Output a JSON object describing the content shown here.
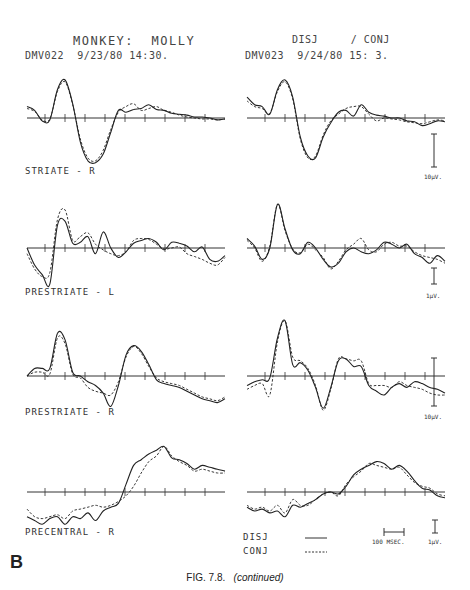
{
  "header": {
    "left_title": "MONKEY:  MOLLY",
    "left_run": "DMV022  9/23/80 14:30.",
    "right_title": "DISJ     / CONJ",
    "right_run": "DMV023  9/24/80 15: 3."
  },
  "panels": {
    "labels": [
      "STRIATE - R",
      "PRESTRIATE - L",
      "PRESTRIATE - R",
      "PRECENTRAL - R"
    ],
    "scale_bars": [
      "10µV.",
      "1µV.",
      "10µV.",
      "1µV."
    ]
  },
  "legend": {
    "disj": "DISJ",
    "conj": "CONJ",
    "time_bar": "100 MSEC.",
    "volt_bar": "1µV."
  },
  "figure": {
    "panel_letter": "B",
    "caption_prefix": "FIG. 7.8.",
    "caption_suffix": "(continued)"
  },
  "chart_data": {
    "type": "line",
    "xlabel": "time (ticks = 100 msec)",
    "ylabel": "amplitude",
    "grid": false,
    "legend_position": "bottom-right",
    "series_names": [
      "DISJ (solid)",
      "CONJ (dashed)"
    ],
    "panels": [
      {
        "row": 0,
        "col": 0,
        "region": "STRIATE - R",
        "session": "DMV022",
        "disj": [
          12,
          8,
          -3,
          -2,
          30,
          40,
          15,
          -25,
          -45,
          -47,
          -38,
          -15,
          8,
          6,
          9,
          10,
          14,
          9,
          8,
          5,
          4,
          3,
          1,
          1,
          0,
          -2,
          -1
        ],
        "conj": [
          10,
          7,
          -2,
          -1,
          28,
          38,
          14,
          -22,
          -42,
          -45,
          -34,
          -12,
          6,
          12,
          15,
          8,
          10,
          12,
          8,
          6,
          3,
          1,
          0,
          -1,
          -1,
          -2,
          -1
        ]
      },
      {
        "row": 0,
        "col": 1,
        "region": "STRIATE - R",
        "session": "DMV023",
        "disj": [
          22,
          14,
          12,
          4,
          30,
          40,
          22,
          -20,
          -40,
          -42,
          -20,
          -5,
          6,
          8,
          2,
          14,
          6,
          3,
          2,
          0,
          0,
          -3,
          -4,
          -8,
          -6,
          -3,
          -4
        ],
        "conj": [
          18,
          12,
          10,
          5,
          28,
          38,
          20,
          -22,
          -42,
          -40,
          -18,
          -3,
          4,
          10,
          12,
          12,
          4,
          -3,
          0,
          -1,
          -2,
          -4,
          -5,
          -6,
          -4,
          -2,
          -3
        ]
      },
      {
        "row": 1,
        "col": 0,
        "region": "PRESTRIATE - L",
        "session": "DMV022",
        "disj": [
          0,
          -18,
          -28,
          -38,
          24,
          28,
          5,
          6,
          12,
          -6,
          17,
          0,
          -10,
          -4,
          5,
          8,
          10,
          6,
          -2,
          6,
          5,
          2,
          -4,
          1,
          -12,
          -14,
          -8
        ],
        "conj": [
          -6,
          -22,
          -30,
          -26,
          30,
          40,
          8,
          12,
          16,
          4,
          -2,
          -6,
          -8,
          -4,
          8,
          10,
          9,
          4,
          -1,
          0,
          1,
          -6,
          -9,
          -12,
          -16,
          -18,
          -10
        ],
        "note": "0 at stimulus"
      },
      {
        "row": 1,
        "col": 1,
        "region": "PRESTRIATE - L",
        "session": "DMV023",
        "disj": [
          10,
          2,
          -12,
          0,
          46,
          20,
          -2,
          -6,
          6,
          0,
          -12,
          -20,
          -16,
          -4,
          0,
          -4,
          -6,
          -2,
          6,
          4,
          0,
          4,
          -6,
          -10,
          -16,
          -8,
          -14
        ],
        "conj": [
          8,
          0,
          -14,
          2,
          46,
          18,
          -1,
          -5,
          4,
          -2,
          -10,
          -22,
          -14,
          -2,
          4,
          10,
          -2,
          -4,
          4,
          6,
          2,
          2,
          -4,
          -8,
          -10,
          -12,
          -16
        ]
      },
      {
        "row": 2,
        "col": 0,
        "region": "PRESTRIATE - R",
        "session": "DMV022",
        "disj": [
          0,
          8,
          8,
          8,
          45,
          38,
          4,
          0,
          -6,
          -10,
          -18,
          -32,
          -10,
          22,
          32,
          26,
          12,
          -4,
          -8,
          -10,
          -12,
          -16,
          -20,
          -24,
          -26,
          -28,
          -24
        ],
        "conj": [
          0,
          4,
          4,
          2,
          40,
          34,
          2,
          -2,
          -12,
          -16,
          -18,
          -20,
          -6,
          20,
          31,
          24,
          10,
          -2,
          -6,
          -8,
          -10,
          -14,
          -18,
          -22,
          -24,
          -26,
          -22
        ]
      },
      {
        "row": 2,
        "col": 1,
        "region": "PRESTRIATE - R",
        "session": "DMV023",
        "disj": [
          -10,
          -6,
          -4,
          -2,
          40,
          58,
          12,
          14,
          6,
          -12,
          -34,
          -12,
          16,
          18,
          10,
          10,
          -10,
          -16,
          -20,
          -12,
          -8,
          -12,
          -6,
          -8,
          -12,
          -14,
          -18
        ],
        "conj": [
          -14,
          -10,
          -8,
          -20,
          36,
          58,
          20,
          16,
          8,
          -10,
          -36,
          -14,
          18,
          18,
          16,
          16,
          -8,
          -10,
          -10,
          -12,
          -6,
          -10,
          -12,
          -14,
          -18,
          -20,
          -20
        ]
      },
      {
        "row": 3,
        "col": 0,
        "region": "PRECENTRAL - R",
        "session": "DMV022",
        "disj": [
          -26,
          -30,
          -34,
          -28,
          -26,
          -34,
          -26,
          -28,
          -22,
          -30,
          -20,
          -16,
          -12,
          8,
          28,
          34,
          40,
          44,
          48,
          36,
          34,
          30,
          24,
          28,
          26,
          24,
          22
        ],
        "conj": [
          -18,
          -26,
          -28,
          -26,
          -24,
          -28,
          -20,
          -18,
          -16,
          -14,
          -16,
          -14,
          -10,
          -4,
          6,
          20,
          32,
          38,
          48,
          38,
          32,
          28,
          22,
          24,
          22,
          20,
          20
        ]
      },
      {
        "row": 3,
        "col": 1,
        "region": "PRECENTRAL - R",
        "session": "DMV023",
        "disj": [
          -16,
          -20,
          -18,
          -22,
          -20,
          -26,
          -14,
          -16,
          -12,
          -8,
          -2,
          0,
          -2,
          6,
          18,
          24,
          28,
          32,
          30,
          24,
          28,
          22,
          12,
          4,
          2,
          -4,
          -6
        ],
        "conj": [
          -14,
          -18,
          -16,
          -20,
          -14,
          -22,
          -8,
          -14,
          -14,
          -8,
          -2,
          0,
          -4,
          8,
          16,
          22,
          30,
          28,
          26,
          24,
          26,
          18,
          10,
          6,
          4,
          -2,
          -4
        ]
      }
    ]
  }
}
